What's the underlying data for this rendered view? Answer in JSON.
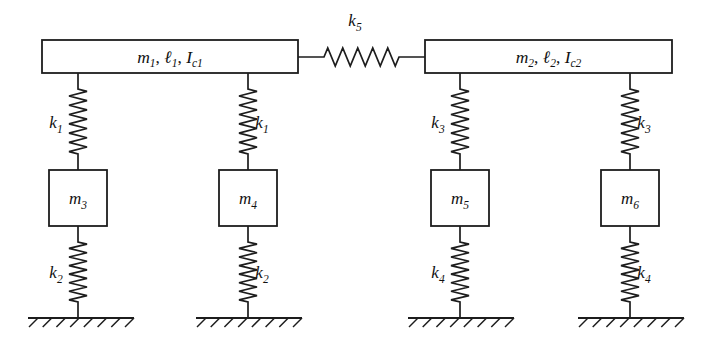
{
  "diagram": {
    "stroke_color": "#1d1d1d",
    "background_color": "#ffffff",
    "rods": [
      {
        "id": "rod-1",
        "label_main": "m",
        "label_sub1": "1",
        "label_len": "ℓ",
        "label_sub2": "1",
        "label_inertia": "I",
        "label_sub3": "c1",
        "full_label": "m1, ℓ1, Ic1",
        "x": 42,
        "y": 40,
        "w": 256,
        "h": 33
      },
      {
        "id": "rod-2",
        "label_main": "m",
        "label_sub1": "2",
        "label_len": "ℓ",
        "label_sub2": "2",
        "label_inertia": "I",
        "label_sub3": "c2",
        "full_label": "m2, ℓ2, Ic2",
        "x": 425,
        "y": 40,
        "w": 247,
        "h": 33
      }
    ],
    "masses": [
      {
        "id": "mass-3",
        "letter": "m",
        "sub": "3",
        "full_label": "m3",
        "cx": 78,
        "y": 170,
        "w": 58,
        "h": 56
      },
      {
        "id": "mass-4",
        "letter": "m",
        "sub": "4",
        "full_label": "m4",
        "cx": 248,
        "y": 170,
        "w": 58,
        "h": 56
      },
      {
        "id": "mass-5",
        "letter": "m",
        "sub": "5",
        "full_label": "m5",
        "cx": 460,
        "y": 170,
        "w": 58,
        "h": 56
      },
      {
        "id": "mass-6",
        "letter": "m",
        "sub": "6",
        "full_label": "m6",
        "cx": 630,
        "y": 170,
        "w": 58,
        "h": 56
      }
    ],
    "springs": [
      {
        "id": "spring-k1-left",
        "letter": "k",
        "sub": "1",
        "full_label": "k1",
        "orientation": "vertical",
        "cx": 78,
        "y1": 73,
        "y2": 170,
        "coils": 7,
        "amp": 9,
        "label_side": "left",
        "label_x": 56,
        "label_y": 128
      },
      {
        "id": "spring-k1-right",
        "letter": "k",
        "sub": "1",
        "full_label": "k1",
        "orientation": "vertical",
        "cx": 248,
        "y1": 73,
        "y2": 170,
        "coils": 7,
        "amp": 9,
        "label_side": "right",
        "label_x": 262,
        "label_y": 128
      },
      {
        "id": "spring-k3-left",
        "letter": "k",
        "sub": "3",
        "full_label": "k3",
        "orientation": "vertical",
        "cx": 460,
        "y1": 73,
        "y2": 170,
        "coils": 7,
        "amp": 9,
        "label_side": "left",
        "label_x": 438,
        "label_y": 128
      },
      {
        "id": "spring-k3-right",
        "letter": "k",
        "sub": "3",
        "full_label": "k3",
        "orientation": "vertical",
        "cx": 630,
        "y1": 73,
        "y2": 170,
        "coils": 7,
        "amp": 9,
        "label_side": "right",
        "label_x": 644,
        "label_y": 128
      },
      {
        "id": "spring-k2-left",
        "letter": "k",
        "sub": "2",
        "full_label": "k2",
        "orientation": "vertical",
        "cx": 78,
        "y1": 226,
        "y2": 318,
        "coils": 7,
        "amp": 9,
        "label_side": "left",
        "label_x": 56,
        "label_y": 278
      },
      {
        "id": "spring-k2-right",
        "letter": "k",
        "sub": "2",
        "full_label": "k2",
        "orientation": "vertical",
        "cx": 248,
        "y1": 226,
        "y2": 318,
        "coils": 7,
        "amp": 9,
        "label_side": "right",
        "label_x": 262,
        "label_y": 278
      },
      {
        "id": "spring-k4-left",
        "letter": "k",
        "sub": "4",
        "full_label": "k4",
        "orientation": "vertical",
        "cx": 460,
        "y1": 226,
        "y2": 318,
        "coils": 7,
        "amp": 9,
        "label_side": "left",
        "label_x": 438,
        "label_y": 278
      },
      {
        "id": "spring-k4-right",
        "letter": "k",
        "sub": "4",
        "full_label": "k4",
        "orientation": "vertical",
        "cx": 630,
        "y1": 226,
        "y2": 318,
        "coils": 7,
        "amp": 9,
        "label_side": "right",
        "label_x": 644,
        "label_y": 278
      },
      {
        "id": "spring-k5-coupler",
        "letter": "k",
        "sub": "5",
        "full_label": "k5",
        "orientation": "horizontal",
        "cy": 57,
        "x1": 298,
        "x2": 425,
        "coils": 5,
        "amp": 9,
        "label_side": "above",
        "label_x": 355,
        "label_y": 26
      }
    ],
    "grounds": [
      {
        "id": "ground-1",
        "x1": 28,
        "x2": 134,
        "y": 318,
        "hatch_count": 8,
        "anchor_x": 78
      },
      {
        "id": "ground-2",
        "x1": 196,
        "x2": 302,
        "y": 318,
        "hatch_count": 8,
        "anchor_x": 248
      },
      {
        "id": "ground-3",
        "x1": 408,
        "x2": 514,
        "y": 318,
        "hatch_count": 8,
        "anchor_x": 460
      },
      {
        "id": "ground-4",
        "x1": 578,
        "x2": 684,
        "y": 318,
        "hatch_count": 8,
        "anchor_x": 630
      }
    ]
  }
}
